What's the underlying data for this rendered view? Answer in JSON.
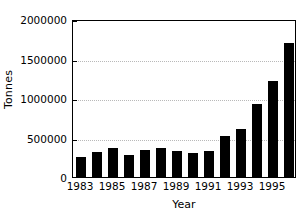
{
  "chart_data": {
    "type": "bar",
    "title": "",
    "xlabel": "Year",
    "ylabel": "Tonnes",
    "categories": [
      1983,
      1984,
      1985,
      1986,
      1987,
      1988,
      1989,
      1990,
      1991,
      1992,
      1993,
      1994,
      1995,
      1996
    ],
    "values": [
      253000,
      316000,
      367000,
      278000,
      348000,
      367000,
      323000,
      310000,
      335000,
      525000,
      608000,
      925000,
      1215000,
      1696000
    ],
    "series": [
      {
        "name": "Tonnes",
        "values": [
          253000,
          316000,
          367000,
          278000,
          348000,
          367000,
          323000,
          310000,
          335000,
          525000,
          608000,
          925000,
          1215000,
          1696000
        ]
      }
    ],
    "ylim": [
      0,
      2000000
    ],
    "ytick_values": [
      0,
      500000,
      1000000,
      1500000,
      2000000
    ],
    "ytick_labels": [
      "0",
      "500000",
      "1000000",
      "1500000",
      "2000000"
    ],
    "xtick_values": [
      1983,
      1985,
      1987,
      1989,
      1991,
      1993,
      1995
    ],
    "xtick_labels": [
      "1983",
      "1985",
      "1987",
      "1989",
      "1991",
      "1993",
      "1995"
    ],
    "grid": true,
    "grid_axis": "y",
    "legend": false,
    "bar_color": "#000000",
    "background_color": "#ffffff",
    "axis_color": "#000000",
    "gridline_color": "#b9b9b9"
  }
}
